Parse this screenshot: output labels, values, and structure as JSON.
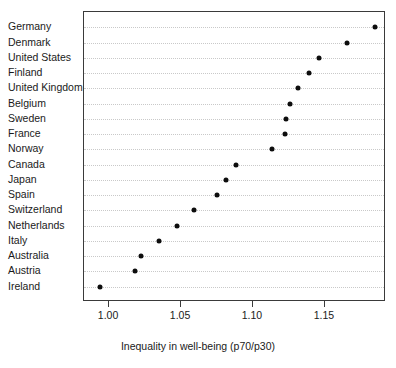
{
  "chart_data": {
    "type": "scatter",
    "title": "",
    "xlabel": "Inequality in well-being (p70/p30)",
    "ylabel": "",
    "xlim": [
      0.9826,
      1.1924
    ],
    "grid": true,
    "legend": null,
    "xticks": [
      "1.00",
      "1.05",
      "1.10",
      "1.15"
    ],
    "xtick_values": [
      1.0,
      1.05,
      1.1,
      1.15
    ],
    "categories": [
      "Germany",
      "Denmark",
      "United States",
      "Finland",
      "United Kingdom",
      "Belgium",
      "Sweden",
      "France",
      "Norway",
      "Canada",
      "Japan",
      "Spain",
      "Switzerland",
      "Netherlands",
      "Italy",
      "Australia",
      "Austria",
      "Ireland"
    ],
    "values": [
      1.185,
      1.165,
      1.146,
      1.139,
      1.131,
      1.126,
      1.123,
      1.122,
      1.113,
      1.088,
      1.081,
      1.075,
      1.059,
      1.047,
      1.035,
      1.022,
      1.018,
      0.994
    ],
    "points": [
      {
        "label": "Germany",
        "value": 1.185
      },
      {
        "label": "Denmark",
        "value": 1.165
      },
      {
        "label": "United States",
        "value": 1.146
      },
      {
        "label": "Finland",
        "value": 1.139
      },
      {
        "label": "United Kingdom",
        "value": 1.131
      },
      {
        "label": "Belgium",
        "value": 1.126
      },
      {
        "label": "Sweden",
        "value": 1.123
      },
      {
        "label": "France",
        "value": 1.122
      },
      {
        "label": "Norway",
        "value": 1.113
      },
      {
        "label": "Canada",
        "value": 1.088
      },
      {
        "label": "Japan",
        "value": 1.081
      },
      {
        "label": "Spain",
        "value": 1.075
      },
      {
        "label": "Switzerland",
        "value": 1.059
      },
      {
        "label": "Netherlands",
        "value": 1.047
      },
      {
        "label": "Italy",
        "value": 1.035
      },
      {
        "label": "Australia",
        "value": 1.022
      },
      {
        "label": "Austria",
        "value": 1.018
      },
      {
        "label": "Ireland",
        "value": 0.994
      }
    ],
    "colors": {
      "marker": "#0d0d0d",
      "gridline": "#c9c9c9",
      "frame": "#3a3a3a",
      "text": "#1a1a1a",
      "background": "#ffffff"
    }
  }
}
